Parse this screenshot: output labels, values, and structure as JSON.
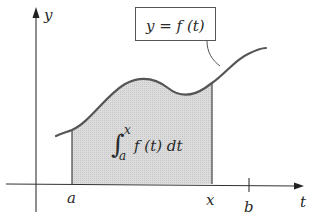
{
  "diagram": {
    "type": "area-under-curve",
    "axes": {
      "x_label": "t",
      "y_label": "y"
    },
    "function_label": "y = f (t)",
    "integral": {
      "symbol": "∫",
      "upper": "x",
      "lower": "a",
      "integrand": "f (t) dt"
    },
    "ticks": {
      "a": "a",
      "x": "x",
      "b": "b"
    },
    "colors": {
      "curve": "#555555",
      "axis": "#333333",
      "shade": "#d9d9d9",
      "box_border": "#555555",
      "text": "#2a2a2a"
    }
  }
}
